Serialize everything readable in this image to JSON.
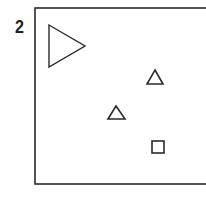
{
  "figure": {
    "label": "2",
    "frame": {
      "x": 35,
      "y": 8,
      "width": 175,
      "height": 176,
      "stroke": "#2a2a2a"
    },
    "shapes": [
      {
        "type": "triangle-right",
        "points": "49,25 85,46 49,67",
        "stroke": "#2a2a2a"
      },
      {
        "type": "triangle-up",
        "points": "155,70 163,84 147,84",
        "stroke": "#2a2a2a"
      },
      {
        "type": "triangle-up",
        "points": "116,106 125,119 108,119",
        "stroke": "#2a2a2a"
      },
      {
        "type": "square",
        "x": 152,
        "y": 141,
        "size": 12,
        "stroke": "#2a2a2a"
      }
    ]
  }
}
